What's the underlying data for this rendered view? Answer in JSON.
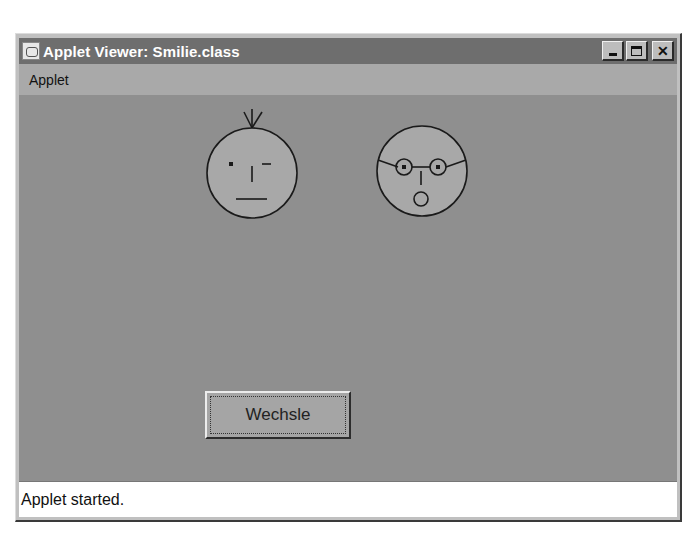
{
  "window": {
    "title": "Applet Viewer: Smilie.class",
    "app_icon": "java-coffee-cup-icon",
    "controls": {
      "minimize": "minimize",
      "maximize": "maximize",
      "close": "✕"
    }
  },
  "menubar": {
    "items": [
      {
        "label": "Applet"
      }
    ]
  },
  "applet": {
    "background": "#8f8f8f",
    "faces": [
      {
        "name": "winking-face",
        "features": [
          "hair-tuft",
          "left-eye-dot",
          "right-eye-wink",
          "nose",
          "flat-mouth"
        ]
      },
      {
        "name": "surprised-face-with-glasses",
        "features": [
          "glasses",
          "nose",
          "o-mouth"
        ]
      }
    ],
    "button": {
      "label": "Wechsle"
    }
  },
  "status": {
    "text": "Applet started."
  }
}
